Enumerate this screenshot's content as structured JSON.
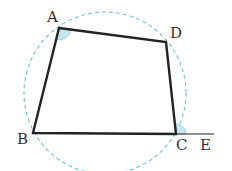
{
  "diagram": {
    "type": "cyclic-quadrilateral",
    "colors": {
      "edge": "#222222",
      "circle": "#7fc4e0",
      "angle_fill": "#c6e6f3",
      "angle_stroke": "#8ccbe4",
      "label": "#333333"
    },
    "circle": {
      "cx": 105,
      "cy": 93,
      "r": 81,
      "style": "dashed"
    },
    "vertices": {
      "A": {
        "label": "A",
        "x": 59,
        "y": 28
      },
      "D": {
        "label": "D",
        "x": 166,
        "y": 42
      },
      "C": {
        "label": "C",
        "x": 176,
        "y": 134
      },
      "B": {
        "label": "B",
        "x": 33,
        "y": 133
      }
    },
    "extension": {
      "label": "E",
      "from": "C",
      "to_x": 214,
      "to_y": 134
    },
    "marked_angles": [
      "∠BAD",
      "∠DCE"
    ]
  }
}
